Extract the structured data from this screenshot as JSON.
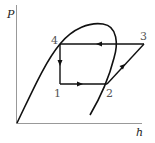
{
  "diagram": {
    "type": "P-h diagram (thermodynamic cycle)",
    "axes": {
      "y_label": "P",
      "x_label": "h"
    },
    "points": [
      {
        "id": "1",
        "label": "1"
      },
      {
        "id": "2",
        "label": "2"
      },
      {
        "id": "3",
        "label": "3"
      },
      {
        "id": "4",
        "label": "4"
      }
    ],
    "cycle_direction": [
      "1 → 2",
      "2 → 3",
      "3 → 4",
      "4 → 1"
    ],
    "colors": {
      "line": "#111111",
      "axis": "#888888",
      "label": "#555555"
    }
  }
}
